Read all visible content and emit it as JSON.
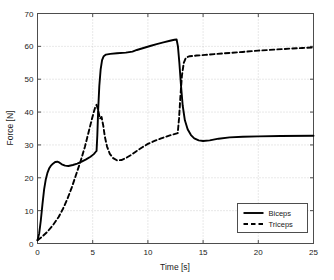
{
  "chart_data": {
    "type": "line",
    "title": "",
    "xlabel": "Time [s]",
    "ylabel": "Force [N]",
    "xlim": [
      0,
      25
    ],
    "ylim": [
      0,
      70
    ],
    "xticks": [
      0,
      5,
      10,
      15,
      20,
      25
    ],
    "yticks": [
      0,
      10,
      20,
      30,
      40,
      50,
      60,
      70
    ],
    "xtick_labels": [
      "0",
      "5",
      "10",
      "15",
      "20",
      "25"
    ],
    "ytick_labels": [
      "0",
      "10",
      "20",
      "30",
      "40",
      "50",
      "60",
      "70"
    ],
    "grid": true,
    "grid_style": "dotted",
    "legend_position": "lower right",
    "legend_entries": [
      "Biceps",
      "Triceps"
    ],
    "series": [
      {
        "name": "Biceps",
        "style": "solid",
        "color": "#000000",
        "points": [
          [
            0.0,
            1.0
          ],
          [
            0.15,
            3.0
          ],
          [
            0.3,
            7.0
          ],
          [
            0.45,
            12.0
          ],
          [
            0.6,
            16.5
          ],
          [
            0.75,
            19.5
          ],
          [
            0.9,
            21.5
          ],
          [
            1.05,
            22.8
          ],
          [
            1.2,
            23.6
          ],
          [
            1.4,
            24.3
          ],
          [
            1.6,
            24.8
          ],
          [
            1.8,
            24.9
          ],
          [
            2.0,
            24.6
          ],
          [
            2.2,
            24.1
          ],
          [
            2.5,
            23.7
          ],
          [
            2.8,
            23.6
          ],
          [
            3.2,
            23.9
          ],
          [
            3.6,
            24.3
          ],
          [
            4.0,
            24.9
          ],
          [
            4.4,
            25.6
          ],
          [
            4.8,
            26.4
          ],
          [
            5.1,
            27.2
          ],
          [
            5.3,
            28.0
          ],
          [
            5.35,
            28.2
          ],
          [
            5.42,
            33.0
          ],
          [
            5.5,
            41.0
          ],
          [
            5.6,
            48.0
          ],
          [
            5.72,
            53.0
          ],
          [
            5.85,
            55.8
          ],
          [
            6.0,
            57.0
          ],
          [
            6.2,
            57.5
          ],
          [
            6.6,
            57.7
          ],
          [
            7.2,
            57.9
          ],
          [
            8.0,
            58.1
          ],
          [
            8.6,
            58.4
          ],
          [
            9.0,
            58.9
          ],
          [
            9.6,
            59.5
          ],
          [
            10.2,
            60.1
          ],
          [
            10.8,
            60.7
          ],
          [
            11.4,
            61.2
          ],
          [
            12.0,
            61.7
          ],
          [
            12.4,
            62.0
          ],
          [
            12.6,
            62.1
          ],
          [
            12.72,
            60.0
          ],
          [
            12.85,
            55.0
          ],
          [
            13.0,
            48.0
          ],
          [
            13.15,
            42.0
          ],
          [
            13.35,
            37.5
          ],
          [
            13.6,
            34.8
          ],
          [
            13.9,
            33.0
          ],
          [
            14.2,
            32.0
          ],
          [
            14.6,
            31.4
          ],
          [
            15.0,
            31.2
          ],
          [
            15.6,
            31.4
          ],
          [
            16.4,
            31.9
          ],
          [
            17.4,
            32.3
          ],
          [
            18.6,
            32.5
          ],
          [
            20.0,
            32.6
          ],
          [
            22.0,
            32.7
          ],
          [
            25.0,
            32.8
          ]
        ]
      },
      {
        "name": "Triceps",
        "style": "dashed",
        "color": "#000000",
        "points": [
          [
            0.0,
            1.0
          ],
          [
            0.4,
            2.0
          ],
          [
            0.9,
            3.6
          ],
          [
            1.4,
            5.6
          ],
          [
            1.9,
            8.0
          ],
          [
            2.3,
            10.5
          ],
          [
            2.7,
            13.5
          ],
          [
            3.1,
            17.0
          ],
          [
            3.5,
            21.0
          ],
          [
            3.9,
            25.0
          ],
          [
            4.3,
            29.5
          ],
          [
            4.6,
            33.5
          ],
          [
            4.9,
            37.5
          ],
          [
            5.1,
            40.0
          ],
          [
            5.25,
            41.7
          ],
          [
            5.35,
            42.2
          ],
          [
            5.5,
            40.5
          ],
          [
            5.65,
            38.0
          ],
          [
            5.8,
            38.5
          ],
          [
            5.95,
            36.0
          ],
          [
            6.1,
            32.5
          ],
          [
            6.3,
            29.5
          ],
          [
            6.55,
            27.3
          ],
          [
            6.85,
            26.0
          ],
          [
            7.2,
            25.3
          ],
          [
            7.6,
            25.4
          ],
          [
            8.0,
            26.0
          ],
          [
            8.5,
            27.0
          ],
          [
            9.0,
            28.2
          ],
          [
            9.5,
            29.3
          ],
          [
            10.0,
            30.3
          ],
          [
            10.6,
            31.2
          ],
          [
            11.2,
            32.0
          ],
          [
            11.8,
            32.7
          ],
          [
            12.4,
            33.3
          ],
          [
            12.7,
            33.6
          ],
          [
            12.82,
            38.0
          ],
          [
            12.95,
            45.0
          ],
          [
            13.08,
            51.0
          ],
          [
            13.25,
            55.0
          ],
          [
            13.45,
            56.6
          ],
          [
            13.8,
            57.0
          ],
          [
            14.4,
            57.2
          ],
          [
            15.2,
            57.4
          ],
          [
            16.2,
            57.7
          ],
          [
            17.4,
            58.0
          ],
          [
            18.6,
            58.3
          ],
          [
            20.0,
            58.7
          ],
          [
            21.4,
            59.0
          ],
          [
            22.8,
            59.3
          ],
          [
            24.0,
            59.5
          ],
          [
            25.0,
            59.7
          ]
        ]
      }
    ]
  },
  "axes": {
    "x_title": "Time [s]",
    "y_title": "Force [N]"
  },
  "legend": {
    "items": [
      {
        "label": "Biceps",
        "style": "solid"
      },
      {
        "label": "Triceps",
        "style": "dashed"
      }
    ]
  },
  "colors": {
    "line": "#000000",
    "axis": "#4d4d4d",
    "grid": "#b3b3b3",
    "background": "#ffffff",
    "text": "#1a1a1a"
  }
}
